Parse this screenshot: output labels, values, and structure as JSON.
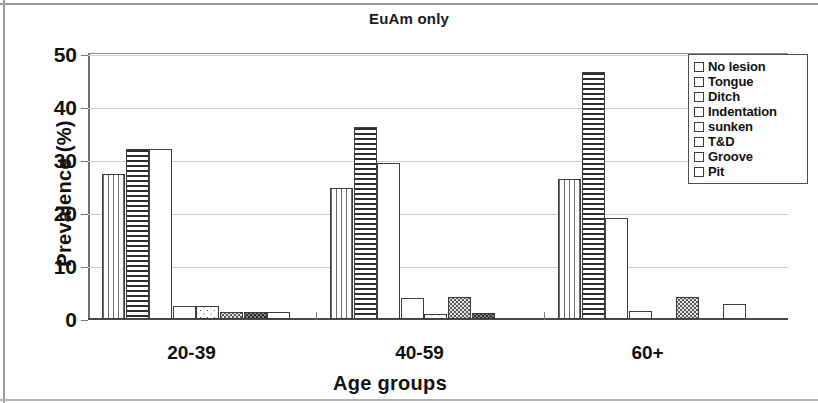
{
  "chart_data": {
    "type": "bar",
    "title": "EuAm only",
    "xlabel": "Age groups",
    "ylabel": "Prevalence (%)",
    "categories": [
      "20-39",
      "40-59",
      "60+"
    ],
    "ylim": [
      0,
      50
    ],
    "yticks": [
      0,
      10,
      20,
      30,
      40,
      50
    ],
    "grid": true,
    "legend_position": "top-right",
    "series": [
      {
        "name": "No lesion",
        "pattern": "vertical-lines",
        "values": [
          27.3,
          24.8,
          26.5
        ]
      },
      {
        "name": "Tongue",
        "pattern": "horizontal-lines",
        "values": [
          32.1,
          36.2,
          46.7
        ]
      },
      {
        "name": "Ditch",
        "pattern": "solid-white",
        "values": [
          32.1,
          29.5,
          19.1
        ]
      },
      {
        "name": "Indentation",
        "pattern": "solid-white",
        "values": [
          2.4,
          4.0,
          1.5
        ]
      },
      {
        "name": "sunken",
        "pattern": "sparse-dots",
        "values": [
          2.4,
          1.0,
          0
        ]
      },
      {
        "name": "T&D",
        "pattern": "dense-dots",
        "values": [
          1.4,
          4.2,
          4.2
        ]
      },
      {
        "name": "Groove",
        "pattern": "dark-grey",
        "values": [
          1.4,
          1.2,
          0
        ]
      },
      {
        "name": "Pit",
        "pattern": "solid-white",
        "values": [
          1.4,
          0,
          2.9
        ]
      }
    ]
  },
  "axis": {
    "ytick_labels": [
      "0",
      "10",
      "20",
      "30",
      "40",
      "50"
    ],
    "xtick_labels": [
      "20-39",
      "40-59",
      "60+"
    ]
  },
  "legend": {
    "items": [
      {
        "label": "No lesion"
      },
      {
        "label": "Tongue"
      },
      {
        "label": "Ditch"
      },
      {
        "label": "Indentation"
      },
      {
        "label": "sunken"
      },
      {
        "label": "T&D"
      },
      {
        "label": "Groove"
      },
      {
        "label": "Pit"
      }
    ]
  }
}
